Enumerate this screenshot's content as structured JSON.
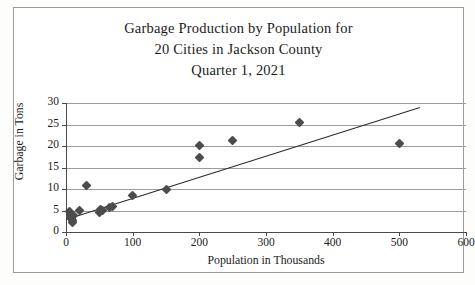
{
  "title": {
    "line1": "Garbage Production by Population for",
    "line2": "20 Cities in Jackson County",
    "line3": "Quarter 1, 2021"
  },
  "chart_data": {
    "type": "scatter",
    "title": "Garbage Production by Population for 20 Cities in Jackson County Quarter 1, 2021",
    "xlabel": "Population in Thousands",
    "ylabel": "Garbage in Tons",
    "xlim": [
      0,
      600
    ],
    "ylim": [
      0,
      30
    ],
    "xticks": [
      0,
      100,
      200,
      300,
      400,
      500,
      600
    ],
    "yticks": [
      0,
      5,
      10,
      15,
      20,
      25,
      30
    ],
    "grid": "horizontal",
    "legend": "none",
    "marker": "diamond",
    "marker_color": "#4c4c4c",
    "points": [
      {
        "x": 5,
        "y": 4.8
      },
      {
        "x": 6,
        "y": 4.2
      },
      {
        "x": 7,
        "y": 3.6
      },
      {
        "x": 8,
        "y": 3.2
      },
      {
        "x": 9,
        "y": 2.6
      },
      {
        "x": 10,
        "y": 2.3
      },
      {
        "x": 11,
        "y": 3.9
      },
      {
        "x": 20,
        "y": 5.1
      },
      {
        "x": 30,
        "y": 10.9
      },
      {
        "x": 50,
        "y": 4.6
      },
      {
        "x": 52,
        "y": 5.2
      },
      {
        "x": 55,
        "y": 5.0
      },
      {
        "x": 65,
        "y": 5.8
      },
      {
        "x": 70,
        "y": 6.0
      },
      {
        "x": 100,
        "y": 8.5
      },
      {
        "x": 150,
        "y": 10.0
      },
      {
        "x": 200,
        "y": 20.2
      },
      {
        "x": 200,
        "y": 17.3
      },
      {
        "x": 250,
        "y": 21.3
      },
      {
        "x": 350,
        "y": 25.4
      },
      {
        "x": 500,
        "y": 20.5
      }
    ],
    "trendline": {
      "color": "#2a2a2a",
      "x_start": 0,
      "y_start": 3.0,
      "x_end": 530,
      "y_end": 29.0
    }
  },
  "axes": {
    "y_tick_labels": [
      "0",
      "5",
      "10",
      "15",
      "20",
      "25",
      "30"
    ],
    "x_tick_labels": [
      "0",
      "100",
      "200",
      "300",
      "400",
      "500",
      "600"
    ],
    "x_title": "Population in Thousands",
    "y_title": "Garbage in Tons"
  }
}
